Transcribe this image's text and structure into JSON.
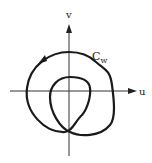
{
  "diagram": {
    "type": "complex-plane-curve",
    "axes": {
      "horizontal_label": "u",
      "vertical_label": "v"
    },
    "curve": {
      "label_main": "C",
      "label_sub": "w",
      "direction": "counter-clockwise",
      "winding_about_origin": 2
    },
    "colors": {
      "stroke": "#1a1a1a",
      "axis": "#333333",
      "background": "#ffffff"
    }
  }
}
